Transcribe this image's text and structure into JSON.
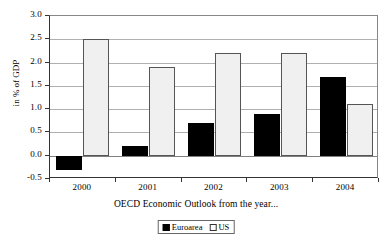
{
  "chart_data": {
    "type": "bar",
    "title": "",
    "subtitle": "",
    "xlabel": "OECD Economic Outlook from the year...",
    "ylabel": "in % of GDP",
    "categories": [
      "2000",
      "2001",
      "2002",
      "2003",
      "2004"
    ],
    "series": [
      {
        "name": "Euroarea",
        "color": "#000000",
        "values": [
          -0.3,
          0.2,
          0.7,
          0.9,
          1.7
        ]
      },
      {
        "name": "US",
        "color": "#f0f0f0",
        "values": [
          2.5,
          1.9,
          2.2,
          2.2,
          1.1
        ]
      }
    ],
    "ylim": [
      -0.5,
      3.0
    ],
    "ytick_step": 0.5,
    "yticks": [
      "3.0",
      "2.5",
      "2.0",
      "1.5",
      "1.0",
      "0.5",
      "0.0",
      "-0.5"
    ],
    "ytick_values": [
      3.0,
      2.5,
      2.0,
      1.5,
      1.0,
      0.5,
      0.0,
      -0.5
    ],
    "grid": true,
    "grid_axis": "y",
    "legend_position": "bottom",
    "annotations": []
  },
  "legend": {
    "items": [
      {
        "label": "Euroarea",
        "swatch": "black-square-icon"
      },
      {
        "label": "US",
        "swatch": "white-square-icon"
      }
    ]
  }
}
